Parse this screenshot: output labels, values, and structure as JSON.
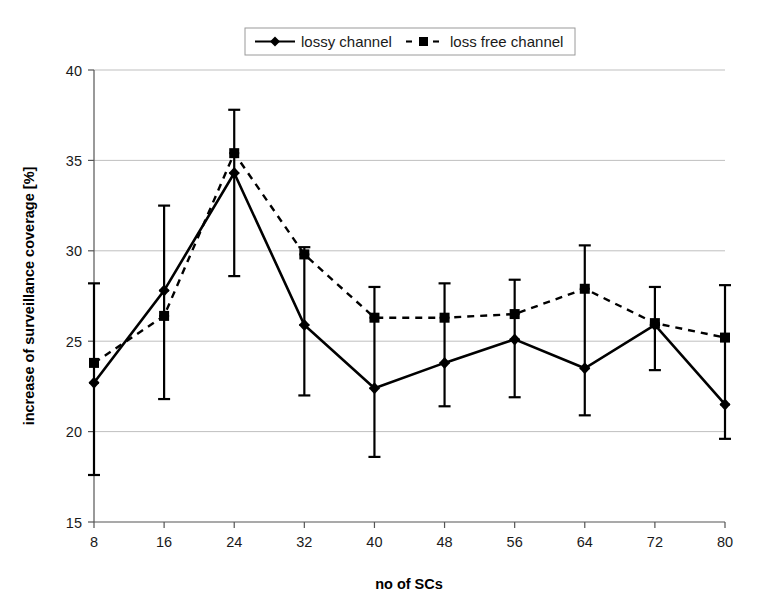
{
  "chart_data": {
    "type": "line",
    "title": "",
    "xlabel": "no of SCs",
    "ylabel": "increase of surveillance coverage [%]",
    "x": [
      8,
      16,
      24,
      32,
      40,
      48,
      56,
      64,
      72,
      80
    ],
    "xtick_labels": [
      "8",
      "16",
      "24",
      "32",
      "40",
      "48",
      "56",
      "64",
      "72",
      "80"
    ],
    "ytick_labels": [
      "15",
      "20",
      "25",
      "30",
      "35",
      "40"
    ],
    "yticks": [
      15,
      20,
      25,
      30,
      35,
      40
    ],
    "xlim": [
      8,
      80
    ],
    "ylim": [
      15,
      40
    ],
    "grid": "horizontal",
    "legend_position": "top-center",
    "series": [
      {
        "name": "lossy channel",
        "marker": "diamond",
        "linestyle": "solid",
        "color": "#000000",
        "values": [
          22.7,
          27.8,
          34.3,
          25.9,
          22.4,
          23.8,
          25.1,
          23.5,
          25.9,
          21.5
        ],
        "err_low": [
          17.6,
          21.8,
          28.6,
          22.0,
          18.6,
          21.4,
          21.9,
          20.9,
          23.4,
          19.6
        ],
        "err_high": [
          28.2,
          32.5,
          37.8,
          30.2,
          28.0,
          28.2,
          28.4,
          30.3,
          28.0,
          28.1
        ]
      },
      {
        "name": "loss free channel",
        "marker": "square",
        "linestyle": "dashed",
        "color": "#000000",
        "values": [
          23.8,
          26.4,
          35.4,
          29.8,
          26.3,
          26.3,
          26.5,
          27.9,
          26.0,
          25.2
        ]
      }
    ],
    "legend": [
      {
        "label": "lossy channel",
        "marker": "diamond",
        "linestyle": "solid"
      },
      {
        "label": "loss free channel",
        "marker": "square",
        "linestyle": "dashed"
      }
    ]
  },
  "figure": {
    "plot_left": 94,
    "plot_right": 725,
    "plot_top": 70,
    "plot_bottom": 522
  }
}
